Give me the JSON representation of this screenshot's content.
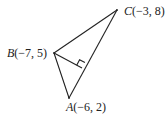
{
  "diagram": {
    "type": "geometry-triangle",
    "stroke_color": "#222222",
    "background": "#ffffff",
    "vertices": [
      {
        "name": "A",
        "coords_label": "(−6, 2)",
        "x": 69,
        "y": 98
      },
      {
        "name": "B",
        "coords_label": "(−7, 5)",
        "x": 54,
        "y": 53
      },
      {
        "name": "C",
        "coords_label": "(−3, 8)",
        "x": 117,
        "y": 10
      }
    ],
    "altitude": {
      "from": "B",
      "to_side": "AC",
      "foot_x": 82,
      "foot_y": 68,
      "right_angle_marker": true
    },
    "labels": {
      "A_letter": "A",
      "A_coords": "(−6, 2)",
      "B_letter": "B",
      "B_coords": "(−7, 5)",
      "C_letter": "C",
      "C_coords": "(−3, 8)"
    }
  }
}
